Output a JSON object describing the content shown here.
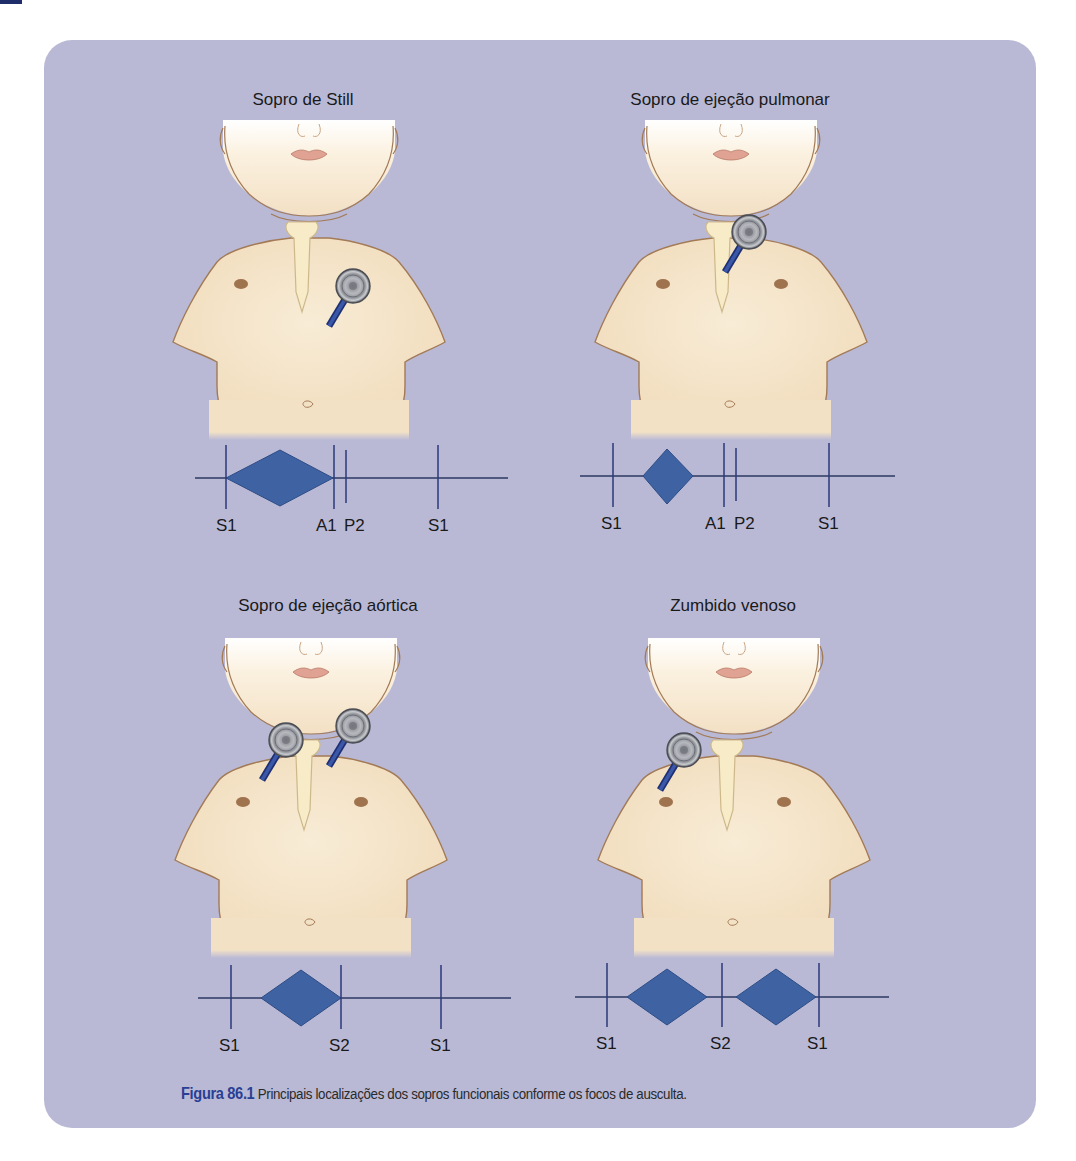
{
  "figure": {
    "panel_color": "#b9b9d6",
    "accent_color": "#3f63a2",
    "line_color": "#2c3a63",
    "caption": {
      "number": "Figura 86.1",
      "text": " Principais localizações dos sopros funcionais conforme os focos de ausculta."
    },
    "panels": [
      {
        "title": "Sopro de Still",
        "stethoscope_positions": [
          "left lower sternal border / mesocardium"
        ],
        "phonocardiogram": {
          "labels": [
            "S1",
            "A1",
            "P2",
            "S1"
          ],
          "murmur": "mid-systolic diamond between S1 and A1"
        }
      },
      {
        "title": "Sopro de ejeção pulmonar",
        "stethoscope_positions": [
          "left upper sternal border (pulmonary area)"
        ],
        "phonocardiogram": {
          "labels": [
            "S1",
            "A1",
            "P2",
            "S1"
          ],
          "murmur": "short early-systolic diamond"
        }
      },
      {
        "title": "Sopro de ejeção aórtica",
        "stethoscope_positions": [
          "right supraclavicular",
          "left supraclavicular"
        ],
        "phonocardiogram": {
          "labels": [
            "S1",
            "S2",
            "S1"
          ],
          "murmur": "systolic diamond ending at S2"
        }
      },
      {
        "title": "Zumbido venoso",
        "stethoscope_positions": [
          "right infraclavicular"
        ],
        "phonocardiogram": {
          "labels": [
            "S1",
            "S2",
            "S1"
          ],
          "murmur": "continuous: systolic and diastolic diamonds"
        }
      }
    ]
  }
}
